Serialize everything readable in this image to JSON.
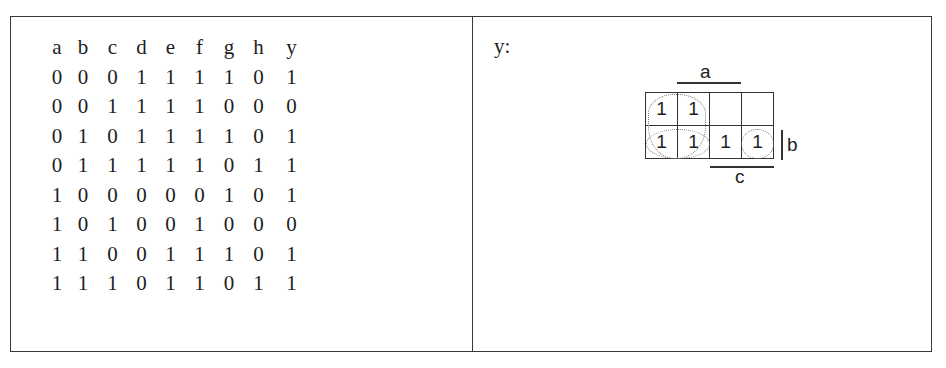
{
  "truth_table": {
    "headers": [
      "a",
      "b",
      "c",
      "d",
      "e",
      "f",
      "g",
      "h",
      "y"
    ],
    "rows": [
      [
        "0",
        "0",
        "0",
        "1",
        "1",
        "1",
        "1",
        "0",
        "1"
      ],
      [
        "0",
        "0",
        "1",
        "1",
        "1",
        "1",
        "0",
        "0",
        "0"
      ],
      [
        "0",
        "1",
        "0",
        "1",
        "1",
        "1",
        "1",
        "0",
        "1"
      ],
      [
        "0",
        "1",
        "1",
        "1",
        "1",
        "1",
        "0",
        "1",
        "1"
      ],
      [
        "1",
        "0",
        "0",
        "0",
        "0",
        "0",
        "1",
        "0",
        "1"
      ],
      [
        "1",
        "0",
        "1",
        "0",
        "0",
        "1",
        "0",
        "0",
        "0"
      ],
      [
        "1",
        "1",
        "0",
        "0",
        "1",
        "1",
        "1",
        "0",
        "1"
      ],
      [
        "1",
        "1",
        "1",
        "0",
        "1",
        "1",
        "0",
        "1",
        "1"
      ]
    ]
  },
  "kmap": {
    "output_label": "y:",
    "var_labels": {
      "top": "a",
      "right": "b",
      "bottom": "c"
    },
    "cells": [
      [
        "1",
        "1",
        "",
        ""
      ],
      [
        "1",
        "1",
        "1",
        "1"
      ]
    ],
    "groups": [
      "row-2 wrap-around loop covering all four cells of bottom row",
      "left column pair loop covering top-left two columns"
    ]
  }
}
